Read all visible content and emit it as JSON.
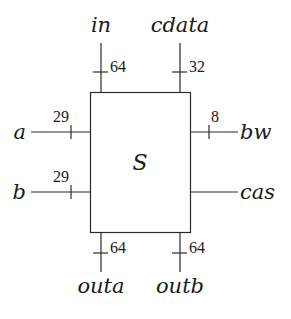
{
  "diagram": {
    "module": {
      "name": "S"
    },
    "ports": {
      "in": {
        "label": "in",
        "width": "64",
        "side": "top"
      },
      "cdata": {
        "label": "cdata",
        "width": "32",
        "side": "top"
      },
      "a": {
        "label": "a",
        "width": "29",
        "side": "left"
      },
      "b": {
        "label": "b",
        "width": "29",
        "side": "left"
      },
      "bw": {
        "label": "bw",
        "width": "8",
        "side": "right"
      },
      "cas": {
        "label": "cas",
        "side": "right"
      },
      "outa": {
        "label": "outa",
        "width": "64",
        "side": "bottom"
      },
      "outb": {
        "label": "outb",
        "width": "64",
        "side": "bottom"
      }
    },
    "colors": {
      "line": "#2a2a2a",
      "text": "#1a1a1a",
      "background": "#ffffff"
    }
  }
}
